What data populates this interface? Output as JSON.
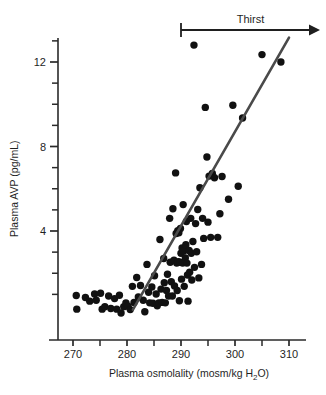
{
  "chart_data": {
    "type": "scatter",
    "title": "",
    "xlabel": "Plasma osmolality (mosm/kg H₂O)",
    "xlabel_main": "Plasma osmolality (mosm/kg H",
    "xlabel_sub": "2",
    "xlabel_tail": "O)",
    "ylabel": "Plasma AVP (pg/mL)",
    "xlim": [
      266,
      312
    ],
    "ylim": [
      0,
      13.6
    ],
    "xticks": [
      270,
      280,
      290,
      300,
      310
    ],
    "xtick_labels": [
      "270",
      "280",
      "290",
      "300",
      "310"
    ],
    "xminor_ticks": [
      275,
      285,
      295,
      305
    ],
    "yticks": [
      4,
      8,
      12
    ],
    "ytick_labels": [
      "4",
      "8",
      "12"
    ],
    "yminor_ticks": [
      1,
      2,
      3,
      5,
      6,
      7,
      9,
      10,
      11,
      13
    ],
    "grid": false,
    "legend": null,
    "marker": "filled-circle",
    "marker_color": "#111111",
    "marker_size_px": 4.6,
    "trend_line": {
      "name": "regression line",
      "color": "#4a4a4a",
      "width_px": 2.6,
      "x_start": 281.1,
      "y_start": 0.28,
      "x_end": 310.0,
      "y_end": 13.15
    },
    "annotations": [
      {
        "name": "thirst-arrow",
        "label": "Thirst",
        "x_start": 290.0,
        "x_end": 312.0,
        "y": 14.6,
        "style": "bar-to-arrow"
      }
    ],
    "points": [
      [
        270.6,
        0.95
      ],
      [
        270.7,
        0.3
      ],
      [
        272.3,
        0.85
      ],
      [
        273.1,
        0.68
      ],
      [
        274.0,
        1.02
      ],
      [
        274.3,
        0.72
      ],
      [
        275.1,
        1.05
      ],
      [
        275.4,
        0.3
      ],
      [
        275.9,
        0.42
      ],
      [
        276.6,
        0.92
      ],
      [
        277.0,
        0.33
      ],
      [
        277.7,
        0.8
      ],
      [
        278.1,
        0.3
      ],
      [
        278.6,
        0.96
      ],
      [
        278.9,
        0.12
      ],
      [
        279.4,
        0.42
      ],
      [
        279.8,
        0.6
      ],
      [
        280.2,
        0.44
      ],
      [
        280.6,
        0.28
      ],
      [
        281.0,
        1.38
      ],
      [
        281.3,
        0.62
      ],
      [
        281.8,
        1.8
      ],
      [
        282.1,
        0.88
      ],
      [
        282.5,
        1.42
      ],
      [
        283.0,
        0.72
      ],
      [
        283.3,
        0.18
      ],
      [
        283.7,
        2.42
      ],
      [
        284.0,
        1.1
      ],
      [
        284.2,
        0.6
      ],
      [
        284.6,
        1.35
      ],
      [
        284.8,
        0.58
      ],
      [
        285.1,
        1.88
      ],
      [
        285.4,
        1.02
      ],
      [
        285.6,
        0.46
      ],
      [
        285.9,
        0.6
      ],
      [
        286.1,
        3.6
      ],
      [
        286.3,
        1.25
      ],
      [
        286.5,
        0.62
      ],
      [
        286.8,
        2.7
      ],
      [
        286.9,
        1.55
      ],
      [
        287.1,
        0.6
      ],
      [
        287.3,
        1.18
      ],
      [
        287.5,
        1.95
      ],
      [
        287.7,
        0.92
      ],
      [
        287.9,
        4.6
      ],
      [
        288.0,
        2.52
      ],
      [
        288.2,
        1.6
      ],
      [
        288.4,
        0.92
      ],
      [
        288.5,
        5.05
      ],
      [
        288.7,
        2.62
      ],
      [
        288.8,
        1.4
      ],
      [
        289.0,
        6.75
      ],
      [
        289.1,
        3.88
      ],
      [
        289.2,
        2.48
      ],
      [
        289.3,
        1.18
      ],
      [
        289.4,
        4.02
      ],
      [
        289.5,
        2.55
      ],
      [
        289.6,
        3.92
      ],
      [
        289.7,
        0.7
      ],
      [
        289.8,
        2.52
      ],
      [
        289.9,
        4.12
      ],
      [
        290.0,
        2.95
      ],
      [
        290.1,
        1.72
      ],
      [
        290.2,
        3.2
      ],
      [
        290.3,
        2.48
      ],
      [
        290.4,
        5.25
      ],
      [
        290.5,
        3.05
      ],
      [
        290.6,
        1.38
      ],
      [
        290.8,
        2.72
      ],
      [
        290.9,
        3.35
      ],
      [
        291.0,
        4.45
      ],
      [
        291.1,
        2.48
      ],
      [
        291.2,
        1.92
      ],
      [
        291.3,
        0.68
      ],
      [
        291.5,
        3.08
      ],
      [
        291.6,
        2.05
      ],
      [
        291.8,
        4.6
      ],
      [
        291.9,
        2.95
      ],
      [
        292.0,
        1.68
      ],
      [
        292.2,
        3.5
      ],
      [
        292.4,
        12.8
      ],
      [
        292.5,
        2.28
      ],
      [
        292.7,
        4.35
      ],
      [
        292.9,
        3.02
      ],
      [
        293.1,
        5.02
      ],
      [
        293.3,
        1.78
      ],
      [
        293.5,
        6.05
      ],
      [
        293.8,
        2.42
      ],
      [
        294.0,
        4.6
      ],
      [
        294.2,
        3.65
      ],
      [
        294.5,
        9.85
      ],
      [
        294.8,
        7.5
      ],
      [
        295.0,
        4.42
      ],
      [
        295.2,
        6.6
      ],
      [
        295.5,
        3.7
      ],
      [
        295.8,
        6.72
      ],
      [
        296.2,
        6.52
      ],
      [
        296.8,
        3.7
      ],
      [
        297.2,
        4.82
      ],
      [
        297.6,
        6.58
      ],
      [
        298.8,
        5.5
      ],
      [
        299.6,
        9.95
      ],
      [
        300.6,
        6.12
      ],
      [
        301.4,
        9.35
      ],
      [
        305.0,
        12.35
      ],
      [
        308.5,
        12.0
      ]
    ]
  },
  "axes": {
    "frame": "left-and-bottom",
    "line_color": "#2a2a2a"
  }
}
